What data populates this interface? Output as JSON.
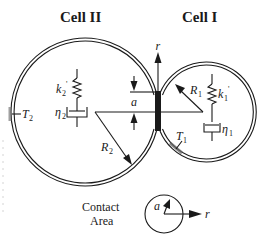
{
  "labels": {
    "cell_left_title": "Cell II",
    "cell_right_title": "Cell I",
    "r_axis": "r",
    "contact_radius": "a",
    "R1": "R",
    "R1_sub": "1",
    "R2": "R",
    "R2_sub": "2",
    "T1": "T",
    "T1_sub": "1",
    "T2": "T",
    "T2_sub": "2",
    "k1": "k",
    "k1_sub": "1",
    "k1_prime": "'",
    "k2": "k",
    "k2_sub": "2",
    "k2_prime": "'",
    "eta1": "η",
    "eta1_sub": "1",
    "eta2": "η",
    "eta2_sub": "2",
    "inset_title_line1": "Contact",
    "inset_title_line2": "Area",
    "inset_a": "a",
    "inset_r": "r"
  },
  "colors": {
    "ink": "#1a1a1a",
    "background": "#ffffff"
  }
}
